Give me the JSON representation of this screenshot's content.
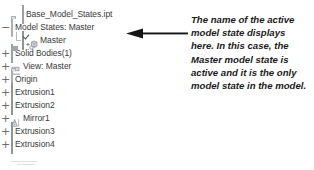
{
  "browser_tree": {
    "name": "model-browser-tree",
    "rows": [
      {
        "label": "Base_Model_States.ipt",
        "icon": "document-icon",
        "expander": "",
        "indent": 11,
        "top": 8
      },
      {
        "label": "Model States: Master",
        "icon": "folder-icon",
        "expander": "minus",
        "indent": 11,
        "top": 21
      },
      {
        "label": "Master",
        "icon": "model-state-icon",
        "expander": "",
        "indent": 22,
        "top": 34
      },
      {
        "label": "Solid Bodies(1)",
        "icon": "solid-bodies-icon",
        "expander": "plus",
        "indent": 11,
        "top": 47
      },
      {
        "label": "View: Master",
        "icon": "view-icon",
        "expander": "plus",
        "indent": 11,
        "top": 60
      },
      {
        "label": "Origin",
        "icon": "folder-icon",
        "expander": "plus",
        "indent": 11,
        "top": 73
      },
      {
        "label": "Extrusion1",
        "icon": "extrusion-icon",
        "expander": "plus",
        "indent": 11,
        "top": 86
      },
      {
        "label": "Extrusion2",
        "icon": "extrusion-icon",
        "expander": "plus",
        "indent": 11,
        "top": 99
      },
      {
        "label": "Mirror1",
        "icon": "mirror-icon",
        "expander": "plus",
        "indent": 11,
        "top": 112
      },
      {
        "label": "Extrusion3",
        "icon": "extrusion-icon",
        "expander": "plus",
        "indent": 11,
        "top": 125
      },
      {
        "label": "Extrusion4",
        "icon": "extrusion-icon",
        "expander": "plus",
        "indent": 11,
        "top": 138
      }
    ],
    "expander_glyphs": {
      "plus": "+",
      "minus": "−"
    }
  },
  "callout": {
    "arrow_icon": "left-arrow-icon",
    "arrow_color": "#151515",
    "annotation_lines": [
      "The name of the active",
      "model state displays",
      "here. In this case, the",
      "Master model state is",
      "active and it is the only",
      "model state in the model."
    ],
    "annotation_text": "The name of the active model state displays here. In this case, the Master model state is active and it is the only model state in the model."
  },
  "colors": {
    "background": "#ffffff",
    "tree_text": "#3a3a3a",
    "annotation_text": "#1b1b1b",
    "tree_line": "#b9b9b9",
    "icon_fill": "#c8cdd2",
    "icon_stroke": "#9aa0a6"
  }
}
